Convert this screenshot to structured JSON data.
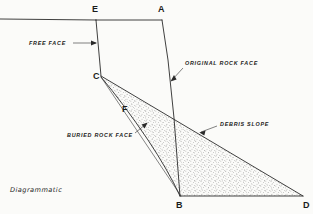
{
  "figure": {
    "caption": "Diagrammatic",
    "type": "geological-cross-section",
    "background_color": "#fbfbf9",
    "line_color": "#2a2a2a",
    "stipple_color": "#5a5a5a"
  },
  "vertices": [
    {
      "id": "E",
      "label": "E",
      "x": 96,
      "y": 20,
      "label_x": 92,
      "label_y": 12
    },
    {
      "id": "A",
      "label": "A",
      "x": 162,
      "y": 20,
      "label_x": 158,
      "label_y": 12
    },
    {
      "id": "C",
      "label": "C",
      "x": 101,
      "y": 76,
      "label_x": 93,
      "label_y": 79
    },
    {
      "id": "F",
      "label": "F",
      "x": 128,
      "y": 117,
      "label_x": 122,
      "label_y": 112
    },
    {
      "id": "B",
      "label": "B",
      "x": 180,
      "y": 196,
      "label_x": 176,
      "label_y": 208
    },
    {
      "id": "D",
      "label": "D",
      "x": 303,
      "y": 196,
      "label_x": 303,
      "label_y": 208
    }
  ],
  "annotations": [
    {
      "id": "free-face",
      "text": "FREE FACE",
      "text_x": 29,
      "text_y": 45,
      "leader": "M 73 43 L 96 43",
      "arrow_x": 96,
      "arrow_y": 43,
      "arrow_dir": "right"
    },
    {
      "id": "original-rock-face",
      "text": "ORIGINAL ROCK FACE",
      "text_x": 185,
      "text_y": 65,
      "leader": "M 183 68 L 172 80",
      "arrow_x": 171,
      "arrow_y": 81,
      "arrow_dir": "down-left"
    },
    {
      "id": "debris-slope",
      "text": "DEBRIS SLOPE",
      "text_x": 220,
      "text_y": 126,
      "leader": "M 217 126 L 201 132",
      "arrow_x": 200,
      "arrow_y": 132,
      "arrow_dir": "left-down"
    },
    {
      "id": "buried-rock-face",
      "text": "BURIED ROCK FACE",
      "text_x": 67,
      "text_y": 137,
      "leader": "M 135 133 L 146 124",
      "arrow_x": 147,
      "arrow_y": 123,
      "arrow_dir": "up-right"
    }
  ],
  "strokes": {
    "ground_surface_left": "M 0 19 L 96 20",
    "crest_E_to_A": "M 96 20 L 162 20",
    "free_face_E_to_C": "M 96 20 L 101 76",
    "original_rock_face_A_to_B": "M 162 20 L 168 60 L 174 118 L 180 196",
    "debris_slope_C_to_D": "M 101 76 L 303 196",
    "buried_rock_face_C_F_B": "M 101 77 Q 123 103 148 140 Q 168 170 180 196",
    "valley_floor_B_to_D": "M 180 196 L 303 196",
    "upper_edge_C_to_B": "M 101 77 L 181 196"
  },
  "regions": {
    "debris_wedge": {
      "id": "debris-wedge",
      "fill_pattern": "stipple",
      "path": "M 101 77 Q 123 103 148 140 Q 168 170 180 196 L 303 196 Z"
    }
  }
}
